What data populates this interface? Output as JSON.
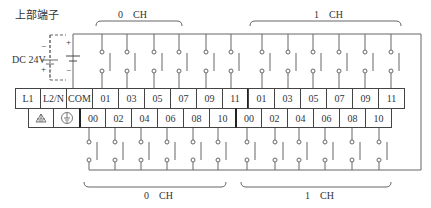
{
  "title": "上部端子",
  "power": {
    "label": "DC 24V",
    "minus": "−",
    "plus": "+"
  },
  "channels": {
    "top_0": "0　CH",
    "top_1": "1　CH",
    "bottom_0": "0　CH",
    "bottom_1": "1　CH"
  },
  "top_row": [
    "L1",
    "L2/N",
    "COM",
    "01",
    "03",
    "05",
    "07",
    "09",
    "11",
    "01",
    "03",
    "05",
    "07",
    "09",
    "11"
  ],
  "bottom_row": [
    "ground-icon",
    "frame-ground-icon",
    "00",
    "02",
    "04",
    "06",
    "08",
    "10",
    "00",
    "02",
    "04",
    "06",
    "08",
    "10"
  ],
  "colors": {
    "line": "#555555",
    "border": "#444444",
    "text": "#333333"
  }
}
